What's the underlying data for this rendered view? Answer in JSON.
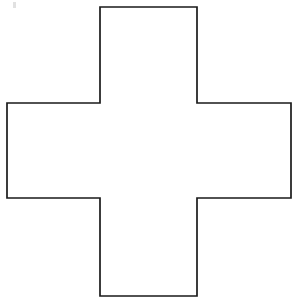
{
  "canvas": {
    "width": 297,
    "height": 304,
    "background_color": "#ffffff"
  },
  "figure": {
    "name": "greek-cross-outline",
    "shape_type": "polygon",
    "sides": 12,
    "fill_color": "#ffffff",
    "stroke_color": "#1a1a1a",
    "stroke_width": 1.7,
    "vertices": [
      {
        "label": "top-left",
        "x": 100,
        "y": 7
      },
      {
        "label": "top-right",
        "x": 197,
        "y": 7
      },
      {
        "label": "upper-right-inner",
        "x": 197,
        "y": 103
      },
      {
        "label": "right-top",
        "x": 291,
        "y": 103
      },
      {
        "label": "right-bottom",
        "x": 291,
        "y": 198
      },
      {
        "label": "lower-right-inner",
        "x": 197,
        "y": 198
      },
      {
        "label": "bottom-right",
        "x": 197,
        "y": 296
      },
      {
        "label": "bottom-left",
        "x": 100,
        "y": 296
      },
      {
        "label": "lower-left-inner",
        "x": 100,
        "y": 198
      },
      {
        "label": "left-bottom",
        "x": 7,
        "y": 198
      },
      {
        "label": "left-top",
        "x": 7,
        "y": 103
      },
      {
        "label": "upper-left-inner",
        "x": 100,
        "y": 103
      }
    ],
    "path": "M 100 7 L 197 7 L 197 103 L 291 103 L 291 198 L 197 198 L 197 296 L 100 296 L 100 198 L 7 198 L 7 103 L 100 103 Z"
  },
  "artifact": {
    "name": "scan-speck",
    "x": 13,
    "y": 2,
    "width": 3,
    "height": 6,
    "color": "#c9c9c9"
  }
}
